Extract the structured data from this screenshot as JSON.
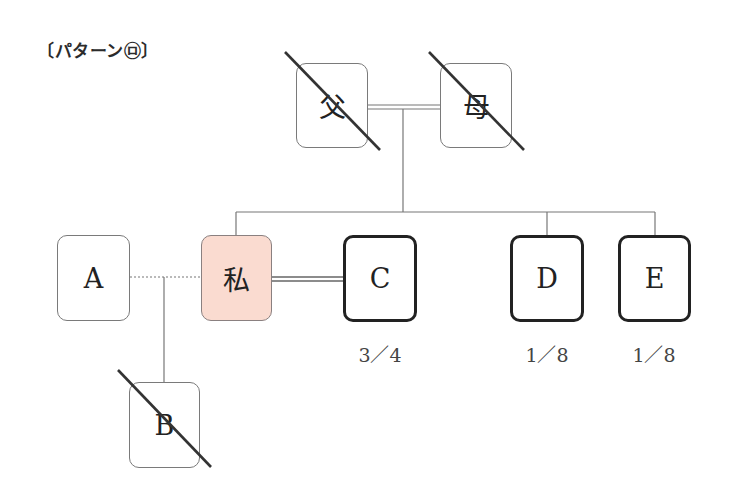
{
  "title": "〔パターン㋺〕",
  "persons": {
    "father": {
      "label": "父",
      "deceased": true
    },
    "mother": {
      "label": "母",
      "deceased": true
    },
    "a": {
      "label": "A",
      "deceased": false
    },
    "self": {
      "label": "私",
      "deceased": false,
      "highlight_color": "#fadbd0"
    },
    "c": {
      "label": "C",
      "deceased": false,
      "share": "3／4"
    },
    "d": {
      "label": "D",
      "deceased": false,
      "share": "1／8"
    },
    "e": {
      "label": "E",
      "deceased": false,
      "share": "1／8"
    },
    "b": {
      "label": "B",
      "deceased": true
    }
  },
  "relations": [
    {
      "type": "marriage",
      "from": "父",
      "to": "母"
    },
    {
      "type": "children",
      "parents": [
        "父",
        "母"
      ],
      "children": [
        "私",
        "D",
        "E"
      ]
    },
    {
      "type": "marriage",
      "from": "私",
      "to": "C"
    },
    {
      "type": "former-partner",
      "from": "A",
      "to": "私"
    },
    {
      "type": "child",
      "parents": [
        "A",
        "私"
      ],
      "children": [
        "B"
      ]
    }
  ]
}
